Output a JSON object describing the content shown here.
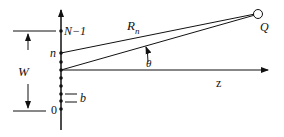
{
  "diagram": {
    "labels": {
      "top_element": "N−1",
      "element_n": "n",
      "element_zero": "0",
      "aperture_width": "W",
      "spacing": "b",
      "distance": "R",
      "distance_sub": "n",
      "angle": "θ",
      "axis": "z",
      "point": "Q"
    },
    "element_count_shown": 10
  }
}
